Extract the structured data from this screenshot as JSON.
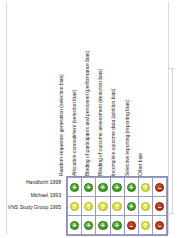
{
  "chart_data": {
    "type": "heatmap",
    "title": "",
    "subtitle": "",
    "xlabel": "",
    "ylabel": "",
    "legend_position": "none",
    "grid": true,
    "categories": [
      "Random sequence generation (selection bias)",
      "Allocation concealment (selection bias)",
      "Binding of participants and personnel (performance bias)",
      "Blinding of outcome assessment (detection bias)",
      "Incomplete outcome data (attrition bias)",
      "Selective reporting (reporting bias)",
      "Other bias"
    ],
    "studies": [
      "Handforth 1998",
      "Michael 1993",
      "VNS Study Group 1995"
    ],
    "judgement_codes": {
      "low": "+",
      "unclear": "?",
      "high": "–"
    },
    "judgement_labels": {
      "low": "Low risk of bias",
      "unclear": "Unclear risk of bias",
      "high": "High risk of bias"
    },
    "judgement_colors": {
      "low": "#4aa32a",
      "unclear": "#d9de3e",
      "high": "#b5361a"
    },
    "series": [
      {
        "name": "Handforth 1998",
        "values": [
          "low",
          "low",
          "low",
          "low",
          "low",
          "unclear",
          "high"
        ]
      },
      {
        "name": "Michael 1993",
        "values": [
          "unclear",
          "unclear",
          "unclear",
          "unclear",
          "low",
          "unclear",
          "high"
        ]
      },
      {
        "name": "VNS Study Group 1995",
        "values": [
          "low",
          "low",
          "low",
          "low",
          "high",
          "unclear",
          "high"
        ]
      }
    ]
  }
}
